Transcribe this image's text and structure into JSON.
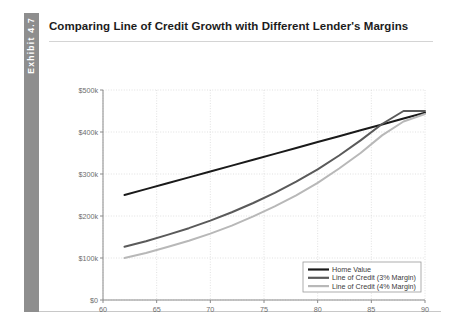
{
  "exhibit": {
    "band_label": "Exhibit 4.7"
  },
  "card": {
    "title": "Comparing Line of Credit Growth with Different Lender's Margins"
  },
  "chart_data": {
    "type": "line",
    "title": "Comparing Line of Credit Growth with Different Lender's Margins",
    "xlabel": "Age",
    "ylabel": "",
    "xlim": [
      60,
      90
    ],
    "ylim": [
      0,
      500000
    ],
    "xticks": [
      60,
      65,
      70,
      75,
      80,
      85,
      90
    ],
    "xtick_labels": [
      "60",
      "65",
      "70",
      "75",
      "80",
      "85",
      "90"
    ],
    "yticks": [
      0,
      100000,
      200000,
      300000,
      400000,
      500000
    ],
    "ytick_labels": [
      "$0",
      "$100k",
      "$200k",
      "$300k",
      "$400k",
      "$500k"
    ],
    "grid": true,
    "legend_position": "lower right",
    "x": [
      62,
      64,
      66,
      68,
      70,
      72,
      74,
      76,
      78,
      80,
      82,
      84,
      86,
      88,
      90
    ],
    "series": [
      {
        "name": "Home Value",
        "color": "#1a1a1a",
        "width": 2.0,
        "values": [
          250000,
          264000,
          278000,
          292000,
          306000,
          320000,
          334000,
          348000,
          362000,
          376000,
          390000,
          404000,
          418000,
          432000,
          446000
        ]
      },
      {
        "name": "Line of Credit (3% Margin)",
        "color": "#5a5a5a",
        "width": 2.0,
        "values": [
          127000,
          140000,
          155000,
          171000,
          189000,
          209000,
          231000,
          255000,
          282000,
          311000,
          344000,
          380000,
          419000,
          450000,
          450000
        ]
      },
      {
        "name": "Line of Credit (4% Margin)",
        "color": "#b8b8b8",
        "width": 2.0,
        "values": [
          100000,
          112000,
          126000,
          141000,
          158000,
          177000,
          199000,
          223000,
          249000,
          279000,
          313000,
          350000,
          392000,
          425000,
          443000
        ]
      }
    ],
    "legend": [
      {
        "label": "Home Value",
        "color": "#1a1a1a"
      },
      {
        "label": "Line of Credit (3% Margin)",
        "color": "#5a5a5a"
      },
      {
        "label": "Line of Credit (4% Margin)",
        "color": "#b8b8b8"
      }
    ]
  }
}
